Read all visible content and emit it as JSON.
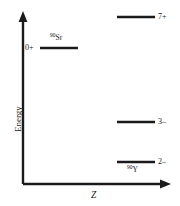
{
  "chart_data": {
    "type": "diagram",
    "title": "",
    "xlabel": "Z",
    "ylabel": "Energy",
    "axes": {
      "x_arrow": true,
      "y_arrow": true,
      "grid": false,
      "ticks": false
    },
    "levels": [
      {
        "id": "sr90-ground",
        "spin_parity": "0+",
        "nuclide": "Sr",
        "mass_number": "90",
        "nuclide_label_position": "above",
        "spin_label_position": "left",
        "x_start": 40,
        "x_end": 78,
        "y": 48
      },
      {
        "id": "y90-7minus",
        "spin_parity": "7+",
        "nuclide": "",
        "mass_number": "",
        "nuclide_label_position": "none",
        "spin_label_position": "right",
        "x_start": 117,
        "x_end": 155,
        "y": 17
      },
      {
        "id": "y90-3minus",
        "spin_parity": "3–",
        "nuclide": "",
        "mass_number": "",
        "nuclide_label_position": "none",
        "spin_label_position": "right",
        "x_start": 117,
        "x_end": 155,
        "y": 122
      },
      {
        "id": "y90-ground",
        "spin_parity": "2–",
        "nuclide": "Y",
        "mass_number": "90",
        "nuclide_label_position": "below",
        "spin_label_position": "right",
        "x_start": 117,
        "x_end": 155,
        "y": 162
      }
    ],
    "colors": {
      "line": "#1a1a1a",
      "axis": "#1a1a1a",
      "background": "#ffffff"
    }
  }
}
